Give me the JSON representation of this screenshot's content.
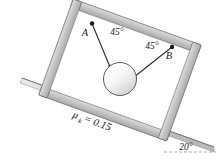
{
  "figure": {
    "background_color": "#ffffff"
  },
  "incline": {
    "angle_label": "20°",
    "angle_value": 20,
    "friction_label": "μ",
    "friction_subscript": "k",
    "friction_equation": "= 0.15",
    "friction_value": 0.15,
    "surface_color": "#c9c9c9",
    "edge_color": "#6e6e6e"
  },
  "frame": {
    "name": "rectangular-frame",
    "fill_color": "#c4c4c4",
    "stroke_color": "#5a5a5a",
    "tilt_degrees": 20
  },
  "sphere": {
    "name": "suspended-sphere",
    "fill_light": "#ffffff",
    "fill_shadow": "#d8d8d8",
    "stroke_color": "#4a4a4a"
  },
  "cables": [
    {
      "attach_label": "A",
      "angle_label": "45°",
      "angle_value": 45,
      "side": "left"
    },
    {
      "attach_label": "B",
      "angle_label": "45°",
      "angle_value": 45,
      "side": "right"
    }
  ],
  "reference_line": {
    "name": "horizontal-dashed-reference",
    "style": "dashed",
    "color": "#9a9a9a"
  }
}
